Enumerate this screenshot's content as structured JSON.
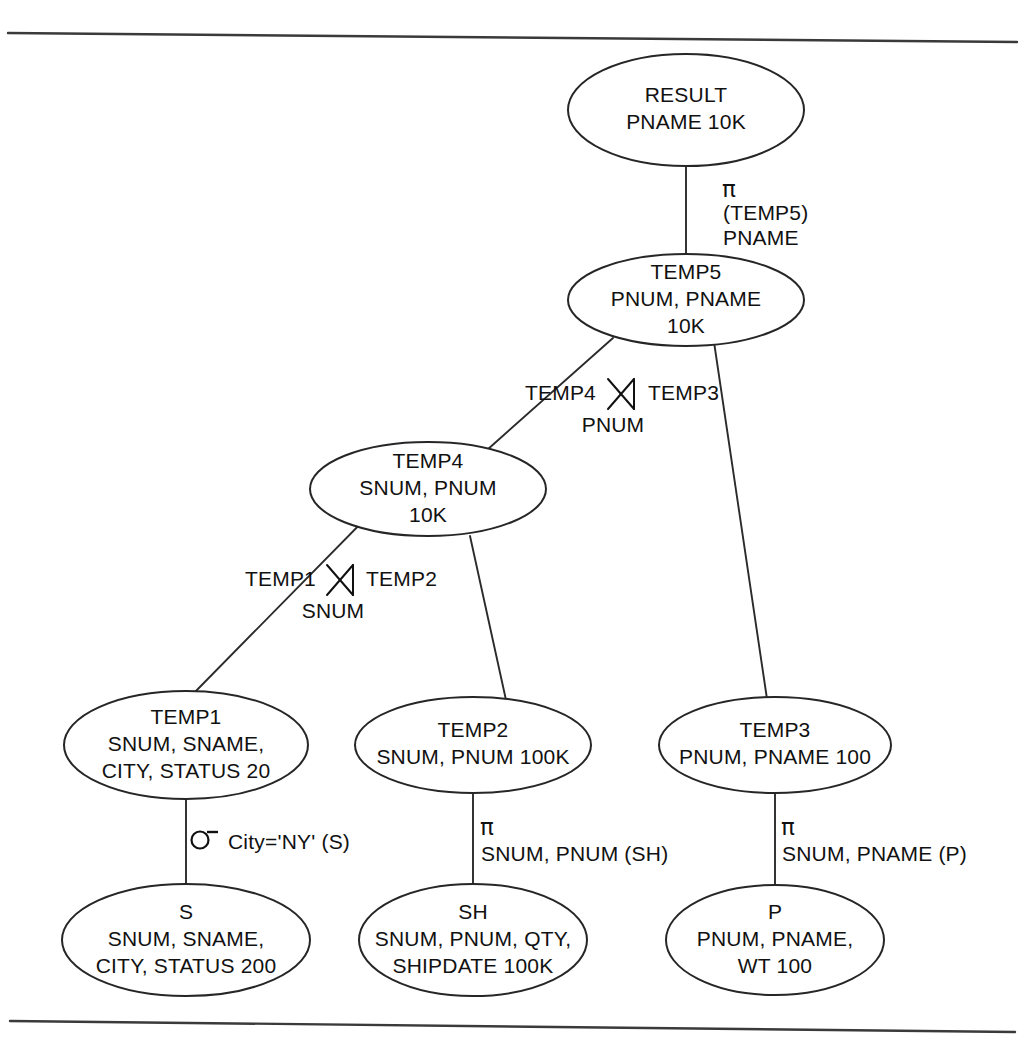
{
  "figure": {
    "kind": "query-execution-tree",
    "title": "",
    "line_color": "#262626",
    "text_color": "#111111",
    "background": "#ffffff"
  },
  "rules": {
    "top": {
      "x1": 8,
      "y1": 33,
      "x2": 1017,
      "y2": 42
    },
    "bottom": {
      "x1": 10,
      "y1": 1021,
      "x2": 1015,
      "y2": 1032
    }
  },
  "nodes": [
    {
      "id": "result",
      "name": "RESULT",
      "lines": [
        "RESULT",
        "PNAME 10K"
      ],
      "cx": 686,
      "cy": 110,
      "rx": 118,
      "ry": 56
    },
    {
      "id": "temp5",
      "name": "TEMP5",
      "lines": [
        "TEMP5",
        "PNUM, PNAME",
        "10K"
      ],
      "cx": 686,
      "cy": 300,
      "rx": 118,
      "ry": 46
    },
    {
      "id": "temp4",
      "name": "TEMP4",
      "lines": [
        "TEMP4",
        "SNUM, PNUM",
        "10K"
      ],
      "cx": 428,
      "cy": 489,
      "rx": 118,
      "ry": 47
    },
    {
      "id": "temp1",
      "name": "TEMP1",
      "lines": [
        "TEMP1",
        "SNUM, SNAME,",
        "CITY, STATUS 20"
      ],
      "cx": 186,
      "cy": 745,
      "rx": 122,
      "ry": 54
    },
    {
      "id": "temp2",
      "name": "TEMP2",
      "lines": [
        "TEMP2",
        "SNUM, PNUM 100K"
      ],
      "cx": 473,
      "cy": 745,
      "rx": 118,
      "ry": 48
    },
    {
      "id": "temp3",
      "name": "TEMP3",
      "lines": [
        "TEMP3",
        "PNUM, PNAME 100"
      ],
      "cx": 775,
      "cy": 745,
      "rx": 116,
      "ry": 48
    },
    {
      "id": "s",
      "name": "S",
      "lines": [
        "S",
        "SNUM, SNAME,",
        "CITY,  STATUS 200"
      ],
      "cx": 186,
      "cy": 940,
      "rx": 124,
      "ry": 56
    },
    {
      "id": "sh",
      "name": "SH",
      "lines": [
        "SH",
        "SNUM, PNUM, QTY,",
        "SHIPDATE 100K"
      ],
      "cx": 473,
      "cy": 940,
      "rx": 114,
      "ry": 56
    },
    {
      "id": "p",
      "name": "P",
      "lines": [
        "P",
        "PNUM, PNAME,",
        "WT 100"
      ],
      "cx": 775,
      "cy": 940,
      "rx": 109,
      "ry": 55
    }
  ],
  "edges": [
    {
      "id": "result-temp5",
      "from": "RESULT",
      "to": "TEMP5",
      "x1": 686,
      "y1": 166,
      "x2": 686,
      "y2": 255
    },
    {
      "id": "temp5-temp4",
      "from": "TEMP5",
      "to": "TEMP4",
      "x1": 613,
      "y1": 338,
      "x2": 487,
      "y2": 450
    },
    {
      "id": "temp5-temp3",
      "from": "TEMP5",
      "to": "TEMP3",
      "x1": 714,
      "y1": 342,
      "x2": 767,
      "y2": 699
    },
    {
      "id": "temp4-temp1",
      "from": "TEMP4",
      "to": "TEMP1",
      "x1": 373,
      "y1": 511,
      "x2": 193,
      "y2": 694
    },
    {
      "id": "temp4-temp2",
      "from": "TEMP4",
      "to": "TEMP2",
      "x1": 470,
      "y1": 536,
      "x2": 506,
      "y2": 700
    },
    {
      "id": "temp1-s",
      "from": "TEMP1",
      "to": "S",
      "x1": 186,
      "y1": 799,
      "x2": 186,
      "y2": 885
    },
    {
      "id": "temp2-sh",
      "from": "TEMP2",
      "to": "SH",
      "x1": 473,
      "y1": 793,
      "x2": 473,
      "y2": 885
    },
    {
      "id": "temp3-p",
      "from": "TEMP3",
      "to": "P",
      "x1": 775,
      "y1": 793,
      "x2": 775,
      "y2": 885
    }
  ],
  "operators": [
    {
      "id": "proj-temp5",
      "type": "projection",
      "symbol": "π",
      "symbol_x": 729,
      "symbol_y": 190,
      "lines": [
        "(TEMP5)",
        "PNAME"
      ],
      "text_x": 723,
      "text_y": 214,
      "line_gap": 25
    },
    {
      "id": "join-pnum",
      "type": "natural-join",
      "symbol": "⋈",
      "left_label": "TEMP4",
      "right_label": "TEMP3",
      "attribute": "PNUM",
      "glyph_cx": 621,
      "glyph_cy": 394,
      "left_x": 596,
      "left_y": 394,
      "right_x": 648,
      "right_y": 394,
      "attr_x": 613,
      "attr_y": 426
    },
    {
      "id": "join-snum",
      "type": "natural-join",
      "symbol": "⋈",
      "left_label": "TEMP1",
      "right_label": "TEMP2",
      "attribute": "SNUM",
      "glyph_cx": 340,
      "glyph_cy": 580,
      "left_x": 316,
      "left_y": 580,
      "right_x": 366,
      "right_y": 580,
      "attr_x": 333,
      "attr_y": 612
    },
    {
      "id": "sel-temp1",
      "type": "selection",
      "symbol": "σ",
      "glyph_cx": 204,
      "glyph_cy": 838,
      "text": "City='NY' (S)",
      "text_x": 228,
      "text_y": 843
    },
    {
      "id": "proj-temp2",
      "type": "projection",
      "symbol": "π",
      "symbol_x": 487,
      "symbol_y": 828,
      "lines": [
        "SNUM, PNUM  (SH)"
      ],
      "text_x": 481,
      "text_y": 855,
      "line_gap": 25
    },
    {
      "id": "proj-temp3",
      "type": "projection",
      "symbol": "π",
      "symbol_x": 788,
      "symbol_y": 828,
      "lines": [
        "SNUM, PNAME (P)"
      ],
      "text_x": 782,
      "text_y": 855,
      "line_gap": 25
    }
  ]
}
